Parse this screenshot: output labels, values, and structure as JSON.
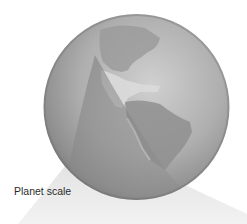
{
  "figure": {
    "caption": "Planet scale",
    "colors": {
      "background": "#ffffff",
      "globe_light": "#c9c9c9",
      "globe_mid": "#a4a4a4",
      "globe_dark": "#7c7c7c",
      "land": "#8e8e8e",
      "land_light": "#d6d6d6",
      "shadow_wedge": "#8a8a8a",
      "light_cone": "#ececec",
      "caption_text": "#2b2b2b"
    }
  }
}
